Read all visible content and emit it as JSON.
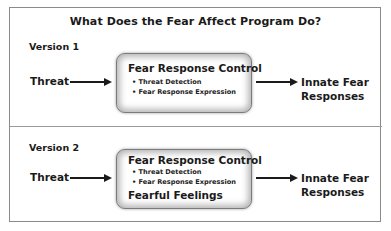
{
  "title": "What Does the Fear Affect Program Do?",
  "versions": [
    {
      "label": "Version 1",
      "input": "Threat",
      "box": {
        "title": "Fear Response Control",
        "bullets": [
          "• Threat Detection",
          "• Fear Response Expression"
        ],
        "extra": ""
      },
      "output_line1": "Innate Fear",
      "output_line2": "Responses"
    },
    {
      "label": "Version 2",
      "input": "Threat",
      "box": {
        "title": "Fear Response Control",
        "bullets": [
          "• Threat Detection",
          "• Fear Response Expression"
        ],
        "extra": "Fearful Feelings"
      },
      "output_line1": "Innate Fear",
      "output_line2": "Responses"
    }
  ],
  "colors": {
    "text": "#1a1a1a",
    "border": "#8a8a8a",
    "box_glow": "#7a7a7a"
  }
}
